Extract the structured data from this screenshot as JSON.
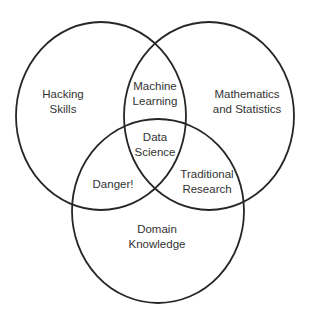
{
  "diagram": {
    "type": "venn",
    "stroke_color": "#262626",
    "text_color": "#333333",
    "sets": [
      {
        "id": "hacking",
        "label_lines": [
          "Hacking",
          "Skills"
        ]
      },
      {
        "id": "math",
        "label_lines": [
          "Mathematics",
          "and Statistics"
        ]
      },
      {
        "id": "domain",
        "label_lines": [
          "Domain",
          "Knowledge"
        ]
      }
    ],
    "intersections": [
      {
        "sets": [
          "hacking",
          "math"
        ],
        "label_lines": [
          "Machine",
          "Learning"
        ]
      },
      {
        "sets": [
          "hacking",
          "domain"
        ],
        "label_lines": [
          "Danger!"
        ]
      },
      {
        "sets": [
          "math",
          "domain"
        ],
        "label_lines": [
          "Traditional",
          "Research"
        ]
      },
      {
        "sets": [
          "hacking",
          "math",
          "domain"
        ],
        "label_lines": [
          "Data",
          "Science"
        ]
      }
    ]
  }
}
